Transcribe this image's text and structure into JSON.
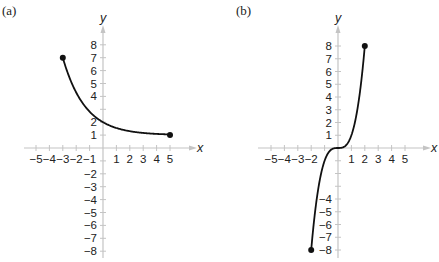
{
  "panels": {
    "a": {
      "label": "(a)"
    },
    "b": {
      "label": "(b)"
    }
  },
  "chart_data": [
    {
      "type": "line",
      "title": "(a)",
      "xlabel": "x",
      "ylabel": "y",
      "xlim": [
        -5,
        5
      ],
      "ylim": [
        -8,
        8
      ],
      "x_ticks": [
        -5,
        -4,
        -3,
        -2,
        -1,
        1,
        2,
        3,
        4,
        5
      ],
      "y_ticks": [
        -8,
        -7,
        -6,
        -5,
        -4,
        -3,
        -2,
        1,
        2,
        4,
        5,
        6,
        7,
        8
      ],
      "grid": false,
      "series": [
        {
          "name": "f",
          "x": [
            -3,
            -2,
            -1,
            0,
            1,
            2,
            3,
            4,
            5
          ],
          "y": [
            7,
            4.3,
            2.8,
            2,
            1.55,
            1.3,
            1.17,
            1.09,
            1.05
          ],
          "endpoints": [
            [
              -3,
              7
            ],
            [
              5,
              1
            ]
          ],
          "endpoint_style": "closed"
        }
      ]
    },
    {
      "type": "line",
      "title": "(b)",
      "xlabel": "x",
      "ylabel": "y",
      "xlim": [
        -5,
        5
      ],
      "ylim": [
        -8,
        8
      ],
      "x_ticks": [
        -5,
        -4,
        -3,
        -2,
        1,
        2,
        3,
        4,
        5
      ],
      "y_ticks": [
        -8,
        -7,
        -6,
        -5,
        -4,
        1,
        2,
        3,
        4,
        5,
        6,
        7,
        8
      ],
      "grid": false,
      "series": [
        {
          "name": "g",
          "x": [
            -2,
            -1.5,
            -1,
            -0.5,
            0,
            0.5,
            1,
            1.5,
            2
          ],
          "y": [
            -8,
            -3.375,
            -1,
            -0.125,
            0,
            0.125,
            1,
            3.375,
            8
          ],
          "endpoints": [
            [
              -2,
              -8
            ],
            [
              2,
              8
            ]
          ],
          "endpoint_style": "closed"
        }
      ]
    }
  ]
}
